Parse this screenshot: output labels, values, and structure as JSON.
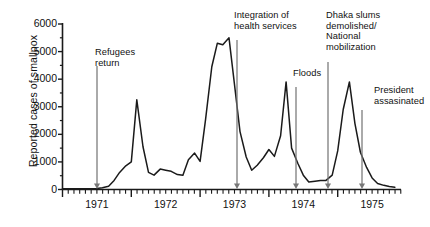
{
  "chart_data": {
    "type": "line",
    "title": "",
    "xlabel": "",
    "ylabel": "Reported cases of smallpox",
    "ylim": [
      0,
      6000
    ],
    "xlim": [
      1971.0,
      1975.92
    ],
    "grid": false,
    "legend": null,
    "ytick_labels": [
      "0",
      "1000",
      "2000",
      "3000",
      "4000",
      "5000",
      "6000"
    ],
    "ytick_values": [
      0,
      1000,
      2000,
      3000,
      4000,
      5000,
      6000
    ],
    "y_minor_step": 500,
    "xtick_labels": [
      "1971",
      "1972",
      "1973",
      "1974",
      "1975"
    ],
    "xtick_values": [
      1971.5,
      1972.5,
      1973.5,
      1974.5,
      1975.5
    ],
    "x_year_boundaries": [
      1971.0,
      1972.0,
      1973.0,
      1974.0,
      1975.0
    ],
    "x_minor_step_months": 1,
    "series_name": "Reported cases of smallpox",
    "line_color": "#1a1a1a",
    "x": [
      1971.0,
      1971.08,
      1971.17,
      1971.25,
      1971.33,
      1971.42,
      1971.5,
      1971.58,
      1971.67,
      1971.75,
      1971.83,
      1971.92,
      1972.0,
      1972.08,
      1972.17,
      1972.25,
      1972.33,
      1972.42,
      1972.5,
      1972.58,
      1972.67,
      1972.75,
      1972.83,
      1972.92,
      1973.0,
      1973.08,
      1973.17,
      1973.25,
      1973.33,
      1973.42,
      1973.5,
      1973.58,
      1973.67,
      1973.75,
      1973.83,
      1973.92,
      1974.0,
      1974.08,
      1974.17,
      1974.25,
      1974.33,
      1974.42,
      1974.5,
      1974.58,
      1974.67,
      1974.75,
      1974.83,
      1974.92,
      1975.0,
      1975.08,
      1975.17,
      1975.25,
      1975.33,
      1975.42,
      1975.5,
      1975.58,
      1975.67,
      1975.75,
      1975.83
    ],
    "values": [
      30,
      30,
      30,
      30,
      30,
      30,
      40,
      60,
      120,
      330,
      620,
      860,
      1000,
      3250,
      1550,
      620,
      520,
      740,
      700,
      660,
      540,
      520,
      1080,
      1320,
      1020,
      2550,
      4450,
      5300,
      5250,
      5500,
      3800,
      2100,
      1180,
      700,
      880,
      1150,
      1450,
      1200,
      1950,
      3900,
      1500,
      950,
      520,
      270,
      300,
      330,
      330,
      520,
      1400,
      2900,
      3900,
      2400,
      1350,
      800,
      420,
      220,
      150,
      110,
      80
    ],
    "annotations": [
      {
        "id": "refugees-return",
        "text": "Refugees\nreturn",
        "x": 1971.75,
        "label_x": 95,
        "label_y": 47,
        "arrow_x": 97,
        "arrow_top": 66
      },
      {
        "id": "integration-health-services",
        "text": "Integration of\nhealth services",
        "x": 1973.55,
        "label_x": 234,
        "label_y": 10,
        "arrow_x": 237,
        "arrow_top": 40
      },
      {
        "id": "floods",
        "text": "Floods",
        "x": 1974.55,
        "label_x": 293,
        "label_y": 68,
        "arrow_x": 296,
        "arrow_top": 87
      },
      {
        "id": "dhaka-slums-national-mobilization",
        "text": "Dhaka slums\ndemolished/\nNational\nmobilization",
        "x": 1974.95,
        "label_x": 326,
        "label_y": 10,
        "arrow_x": 328,
        "arrow_top": 62
      },
      {
        "id": "president-assasinated",
        "text": "President\nassasinated",
        "x": 1975.4,
        "label_x": 374,
        "label_y": 85,
        "arrow_x": 362,
        "arrow_top": 110
      }
    ]
  },
  "figure": {
    "background": "#ffffff",
    "axis_color": "#1a1a1a",
    "annotation_arrow_color": "#777777"
  }
}
